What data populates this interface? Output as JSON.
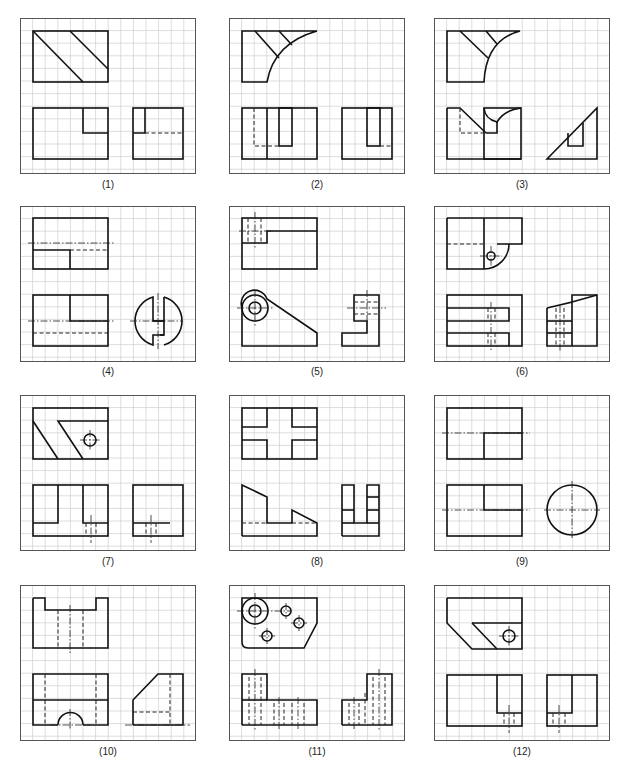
{
  "figure": {
    "panels": [
      {
        "id": 1,
        "label": "(1)",
        "views": [
          "top-view",
          "front-view",
          "side-view"
        ]
      },
      {
        "id": 2,
        "label": "(2)",
        "views": [
          "top-view",
          "front-view",
          "side-view"
        ]
      },
      {
        "id": 3,
        "label": "(3)",
        "views": [
          "top-view",
          "front-view",
          "side-view"
        ]
      },
      {
        "id": 4,
        "label": "(4)",
        "views": [
          "top-view",
          "front-view",
          "side-view"
        ]
      },
      {
        "id": 5,
        "label": "(5)",
        "views": [
          "top-view",
          "front-view",
          "side-view"
        ]
      },
      {
        "id": 6,
        "label": "(6)",
        "views": [
          "top-view",
          "front-view",
          "side-view"
        ]
      },
      {
        "id": 7,
        "label": "(7)",
        "views": [
          "top-view",
          "front-view",
          "side-view"
        ]
      },
      {
        "id": 8,
        "label": "(8)",
        "views": [
          "top-view",
          "front-view",
          "side-view"
        ]
      },
      {
        "id": 9,
        "label": "(9)",
        "views": [
          "top-view",
          "front-view",
          "side-view"
        ]
      },
      {
        "id": 10,
        "label": "(10)",
        "views": [
          "top-view",
          "front-view",
          "side-view"
        ]
      },
      {
        "id": 11,
        "label": "(11)",
        "views": [
          "top-view",
          "front-view",
          "side-view"
        ]
      },
      {
        "id": 12,
        "label": "(12)",
        "views": [
          "top-view",
          "front-view",
          "side-view"
        ]
      }
    ],
    "colors": {
      "line": "#111111",
      "grid": "#cfcfcf",
      "frame": "#555555"
    }
  }
}
